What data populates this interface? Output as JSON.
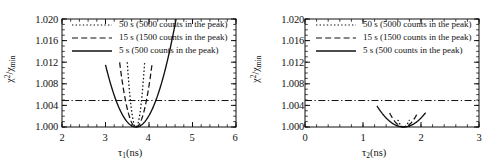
{
  "figure": {
    "panels": [
      {
        "id": "left",
        "xlabel_main": "τ",
        "xlabel_sub": "1",
        "xlabel_unit": "(ns)",
        "ylabel_num": "χ",
        "ylabel_num_sup": "2",
        "ylabel_den": "χ",
        "ylabel_den_sub": "min",
        "yticks": [
          "1.000",
          "1.004",
          "1.008",
          "1.012",
          "1.016",
          "1.020"
        ],
        "xticks": [
          "2",
          "3",
          "4",
          "5",
          "6"
        ]
      },
      {
        "id": "right",
        "xlabel_main": "τ",
        "xlabel_sub": "2",
        "xlabel_unit": "(ns)",
        "ylabel_num": "χ",
        "ylabel_num_sup": "2",
        "ylabel_den": "χ",
        "ylabel_den_sub": "min",
        "yticks": [
          "1.000",
          "1.004",
          "1.008",
          "1.012",
          "1.016",
          "1.020"
        ],
        "xticks": [
          "0",
          "1",
          "2",
          "3"
        ]
      }
    ],
    "legend": [
      {
        "label": "50 s (5000 counts in the peak)",
        "style": "dotted"
      },
      {
        "label": "15 s (1500 counts in the peak)",
        "style": "dashed"
      },
      {
        "label": "5 s (500 counts in the peak)",
        "style": "solid"
      }
    ],
    "line_color": "#111111"
  },
  "chart_data": [
    {
      "type": "line",
      "panel": "left",
      "title": "",
      "xlabel": "τ₁ (ns)",
      "ylabel": "χ²/χ²min",
      "xlim": [
        2,
        6
      ],
      "ylim": [
        1.0,
        1.02
      ],
      "xticks": [
        2,
        3,
        4,
        5,
        6
      ],
      "yticks": [
        1.0,
        1.004,
        1.008,
        1.012,
        1.016,
        1.02
      ],
      "grid": false,
      "legend_position": "top-center",
      "minimum_x": 3.7,
      "minimum_y": 1.0,
      "confidence_line": {
        "value": 1.0049,
        "style": "dash-dot",
        "orientation": "horizontal"
      },
      "series": [
        {
          "name": "50 s (5000 counts in the peak)",
          "style": "dotted",
          "curvature_k": 0.3,
          "x": [
            3.5,
            3.55,
            3.6,
            3.65,
            3.7,
            3.75,
            3.8,
            3.85,
            3.9
          ],
          "y": [
            1.012,
            1.0068,
            1.003,
            1.0008,
            1.0,
            1.0008,
            1.003,
            1.0068,
            1.012
          ]
        },
        {
          "name": "15 s (1500 counts in the peak)",
          "style": "dashed",
          "curvature_k": 0.085,
          "x": [
            3.325,
            3.4,
            3.5,
            3.6,
            3.7,
            3.8,
            3.9,
            4.0,
            4.075
          ],
          "y": [
            1.012,
            1.0077,
            1.0034,
            1.0009,
            1.0,
            1.0009,
            1.0034,
            1.0077,
            1.012
          ]
        },
        {
          "name": "5 s (500 counts in the peak)",
          "style": "solid",
          "curvature_k": 0.0235,
          "x": [
            3.0,
            3.2,
            3.4,
            3.6,
            3.7,
            3.9,
            4.2,
            4.6,
            5.0,
            5.4,
            5.62
          ],
          "y": [
            1.0101,
            1.0056,
            1.0025,
            1.0006,
            1.0,
            1.0006,
            1.0025,
            1.0076,
            1.0158,
            1.0281,
            1.0093
          ]
        }
      ]
    },
    {
      "type": "line",
      "panel": "right",
      "title": "",
      "xlabel": "τ₂ (ns)",
      "ylabel": "χ²/χ²min",
      "xlim": [
        0,
        3
      ],
      "ylim": [
        1.0,
        1.02
      ],
      "xticks": [
        0,
        1,
        2,
        3
      ],
      "yticks": [
        1.0,
        1.004,
        1.008,
        1.012,
        1.016,
        1.02
      ],
      "grid": false,
      "legend_position": "top-center",
      "minimum_x": 1.7,
      "minimum_y": 1.0,
      "confidence_line": {
        "value": 1.0049,
        "style": "dash-dot",
        "orientation": "horizontal"
      },
      "series": [
        {
          "name": "50 s (5000 counts in the peak)",
          "style": "dotted",
          "curvature_k": 0.135,
          "x": [
            1.6,
            1.64,
            1.67,
            1.7,
            1.73,
            1.76,
            1.8
          ],
          "y": [
            1.012,
            1.0052,
            1.0013,
            1.0,
            1.0013,
            1.0052,
            1.012
          ]
        },
        {
          "name": "15 s (1500 counts in the peak)",
          "style": "dashed",
          "curvature_k": 0.045,
          "x": [
            1.46,
            1.52,
            1.6,
            1.7,
            1.8,
            1.88,
            1.94
          ],
          "y": [
            1.012,
            1.0071,
            1.0022,
            1.0,
            1.0022,
            1.0071,
            1.012
          ]
        },
        {
          "name": "5 s (500 counts in the peak)",
          "style": "solid",
          "curvature_k": 0.0185,
          "x": [
            1.24,
            1.35,
            1.5,
            1.6,
            1.7,
            1.8,
            1.9,
            2.0,
            2.08
          ],
          "y": [
            1.012,
            1.0064,
            1.0021,
            1.0008,
            1.0,
            1.0008,
            1.0021,
            1.0064,
            1.0103
          ]
        }
      ]
    }
  ]
}
